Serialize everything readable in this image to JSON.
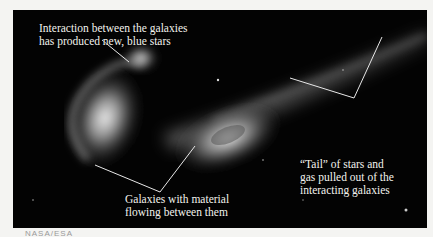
{
  "figure": {
    "annotations": [
      {
        "id": "top",
        "lines": [
          "Interaction between the galaxies",
          "has produced new, blue stars"
        ]
      },
      {
        "id": "right",
        "lines": [
          "“Tail” of stars and",
          "gas pulled out of the",
          "interacting galaxies"
        ]
      },
      {
        "id": "bottom",
        "lines": [
          "Galaxies with material",
          "flowing between them"
        ]
      }
    ],
    "footer_label": "NASA/ESA",
    "colors": {
      "background": "#030303",
      "page": "#f4f4f2",
      "annotation": "#f3f3ee"
    }
  }
}
